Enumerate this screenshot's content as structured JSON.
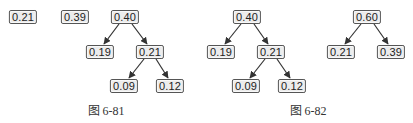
{
  "figures": [
    {
      "caption": "图 6-81",
      "nodes": [
        {
          "id": "a",
          "label": "0.21"
        },
        {
          "id": "b",
          "label": "0.39"
        },
        {
          "id": "c",
          "label": "0.40"
        },
        {
          "id": "d",
          "label": "0.19"
        },
        {
          "id": "e",
          "label": "0.21"
        },
        {
          "id": "f",
          "label": "0.09"
        },
        {
          "id": "g",
          "label": "0.12"
        }
      ],
      "edges": [
        [
          "c",
          "d"
        ],
        [
          "c",
          "e"
        ],
        [
          "e",
          "f"
        ],
        [
          "e",
          "g"
        ]
      ]
    },
    {
      "caption": "图 6-82",
      "nodes": [
        {
          "id": "a",
          "label": "0.40"
        },
        {
          "id": "b",
          "label": "0.19"
        },
        {
          "id": "c",
          "label": "0.21"
        },
        {
          "id": "d",
          "label": "0.09"
        },
        {
          "id": "e",
          "label": "0.12"
        }
      ],
      "edges": [
        [
          "a",
          "b"
        ],
        [
          "a",
          "c"
        ],
        [
          "c",
          "d"
        ],
        [
          "c",
          "e"
        ]
      ]
    },
    {
      "caption": "",
      "nodes": [
        {
          "id": "a",
          "label": "0.60"
        },
        {
          "id": "b",
          "label": "0.21"
        },
        {
          "id": "c",
          "label": "0.39"
        }
      ],
      "edges": [
        [
          "a",
          "b"
        ],
        [
          "a",
          "c"
        ]
      ]
    }
  ],
  "colors": {
    "node_fill": "#ececec",
    "node_border": "#555555",
    "edge": "#333333",
    "text": "#222222"
  }
}
